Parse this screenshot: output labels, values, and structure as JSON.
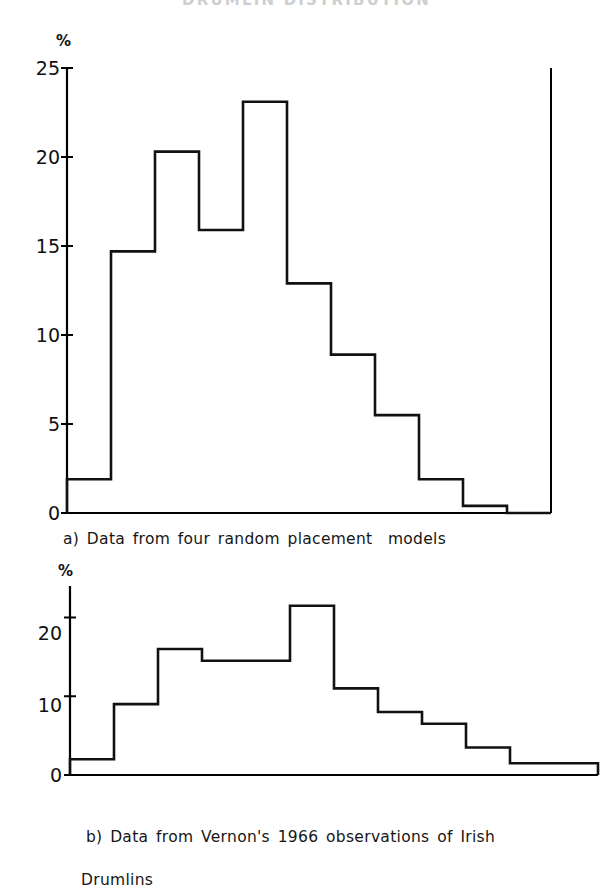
{
  "document": {
    "running_header": "DRUMLIN  DISTRIBUTION"
  },
  "figure_a": {
    "name": "histogram-a",
    "y_axis_unit": "%",
    "y_tick_labels": [
      "25",
      "20",
      "15",
      "10",
      "5",
      "0"
    ],
    "caption": "a) Data from four random placement  models"
  },
  "figure_b": {
    "name": "histogram-b",
    "y_axis_unit": "%",
    "y_tick_labels": [
      "20",
      "10",
      "0"
    ],
    "caption_line1": "b) Data from Vernon's 1966 observations of Irish",
    "caption_line2": "Drumlins"
  },
  "chart_data": [
    {
      "type": "bar",
      "name": "figure_a",
      "title": "a) Data from four random placement  models",
      "style": "step-histogram",
      "xlabel": "",
      "ylabel": "%",
      "ylim": [
        0,
        25
      ],
      "y_ticks": [
        0,
        5,
        10,
        15,
        20,
        25
      ],
      "grid": false,
      "legend": "none",
      "categories": [
        "1",
        "2",
        "3",
        "4",
        "5",
        "6",
        "7",
        "8",
        "9",
        "10",
        "11"
      ],
      "values": [
        1.9,
        14.7,
        20.3,
        15.9,
        23.1,
        12.9,
        8.9,
        5.5,
        1.9,
        0.4,
        0.0
      ],
      "axis_line_color": "#000000"
    },
    {
      "type": "bar",
      "name": "figure_b",
      "title": "b) Data from Vernon's 1966 observations of Irish Drumlins",
      "style": "step-histogram",
      "xlabel": "",
      "ylabel": "%",
      "ylim": [
        0,
        24
      ],
      "y_ticks": [
        0,
        10,
        20
      ],
      "grid": false,
      "legend": "none",
      "categories": [
        "1",
        "2",
        "3",
        "4",
        "5",
        "6",
        "7",
        "8",
        "9",
        "10",
        "11",
        "12"
      ],
      "values": [
        2.0,
        9.0,
        16.0,
        14.5,
        14.5,
        21.5,
        11.0,
        8.0,
        6.5,
        3.5,
        1.5,
        1.5
      ],
      "axis_line_color": "#000000"
    }
  ]
}
